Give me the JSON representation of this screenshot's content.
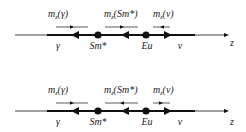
{
  "diagrams": [
    {
      "id": "top",
      "axis_label": "z",
      "moment_labels": [
        {
          "prefix": "m",
          "sub": "z",
          "arg": "(γ)"
        },
        {
          "prefix": "m",
          "sub": "z",
          "arg": "(Sm*)"
        },
        {
          "prefix": "m",
          "sub": "z",
          "arg": "(v)"
        }
      ],
      "point_labels": [
        "γ",
        "Sm*",
        "Eu",
        "v"
      ],
      "small_arrow_directions": [
        "right",
        "right",
        "left"
      ],
      "small_arrow_directions_note": "inferred; tick glyphs too small to read with certainty",
      "main_arrow_directions": [
        "left",
        "left",
        "right"
      ]
    },
    {
      "id": "bottom",
      "axis_label": "z",
      "moment_labels": [
        {
          "prefix": "m",
          "sub": "z",
          "arg": "(γ)"
        },
        {
          "prefix": "m",
          "sub": "z",
          "arg": "(Sm*)"
        },
        {
          "prefix": "m",
          "sub": "z",
          "arg": "(v)"
        }
      ],
      "point_labels": [
        "γ",
        "Sm*",
        "Eu",
        "v"
      ],
      "small_arrow_directions": [
        "right",
        "left",
        "right"
      ],
      "small_arrow_directions_note": "inferred; tick glyphs too small to read with certainty",
      "main_arrow_directions": [
        "left",
        "left",
        "right"
      ]
    }
  ],
  "colors": {
    "line": "#111111",
    "text": "#222222",
    "background": "#ffffff"
  }
}
